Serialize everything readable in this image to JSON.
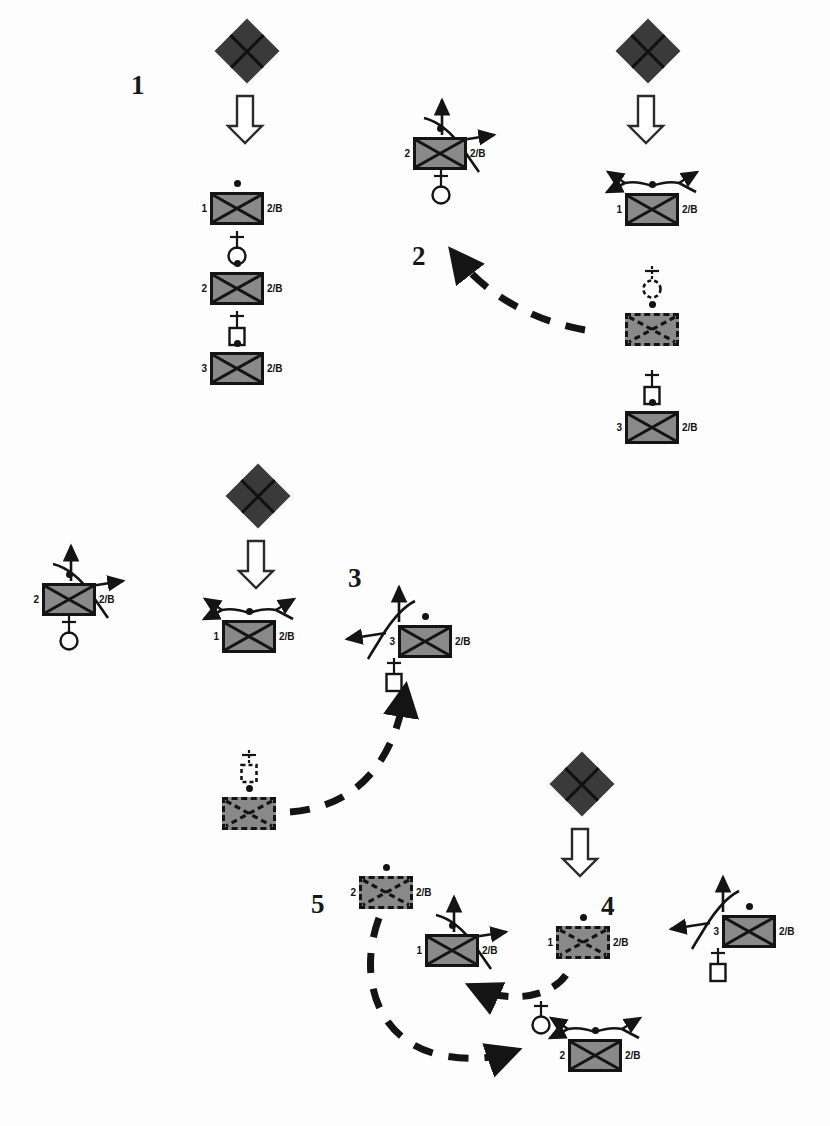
{
  "figure": {
    "kind": "reaction-scheme",
    "background": "#ffffff",
    "palette": {
      "box_fill": "#898989",
      "stroke": "#141414",
      "diamond_fill": "#3a3a3a",
      "label": "#131313"
    },
    "group_labels": [
      {
        "text": "1",
        "x": 131,
        "y": 72
      },
      {
        "text": "2",
        "x": 412,
        "y": 243
      },
      {
        "text": "3",
        "x": 348,
        "y": 565
      },
      {
        "text": "4",
        "x": 601,
        "y": 893
      },
      {
        "text": "5",
        "x": 311,
        "y": 891
      }
    ],
    "diamonds": [
      {
        "x": 224,
        "y": 28
      },
      {
        "x": 625,
        "y": 28
      },
      {
        "x": 235,
        "y": 473
      },
      {
        "x": 559,
        "y": 761
      }
    ],
    "down_arrows": [
      {
        "x": 228,
        "y": 96
      },
      {
        "x": 629,
        "y": 96
      },
      {
        "x": 239,
        "y": 541
      },
      {
        "x": 563,
        "y": 829
      }
    ],
    "units": [
      {
        "id": "g1-u1",
        "x": 210,
        "y": 192,
        "left": "1",
        "right": "2/B",
        "dashed": false,
        "dot": true,
        "deco": "none"
      },
      {
        "id": "g1-u2",
        "x": 210,
        "y": 272,
        "left": "2",
        "right": "2/B",
        "dashed": false,
        "dot": true,
        "deco": "none"
      },
      {
        "id": "g1-u3",
        "x": 210,
        "y": 352,
        "left": "3",
        "right": "2/B",
        "dashed": false,
        "dot": true,
        "deco": "none"
      },
      {
        "id": "g2-u1",
        "x": 413,
        "y": 137,
        "left": "2",
        "right": "2/B",
        "dashed": false,
        "dot": true,
        "deco": "bond-right"
      },
      {
        "id": "g1r-u1",
        "x": 625,
        "y": 193,
        "left": "1",
        "right": "2/B",
        "dashed": false,
        "dot": true,
        "deco": "spray-up"
      },
      {
        "id": "g1r-u2",
        "x": 625,
        "y": 313,
        "left": "",
        "right": "",
        "dashed": true,
        "dot": true,
        "deco": "none"
      },
      {
        "id": "g1r-u3",
        "x": 625,
        "y": 411,
        "left": "3",
        "right": "2/B",
        "dashed": false,
        "dot": true,
        "deco": "none"
      },
      {
        "id": "gl-u1",
        "x": 42,
        "y": 583,
        "left": "2",
        "right": "2/B",
        "dashed": false,
        "dot": true,
        "deco": "bond-right"
      },
      {
        "id": "g3-u1",
        "x": 222,
        "y": 620,
        "left": "1",
        "right": "2/B",
        "dashed": false,
        "dot": true,
        "deco": "spray-up"
      },
      {
        "id": "g3-u2",
        "x": 222,
        "y": 797,
        "left": "",
        "right": "",
        "dashed": true,
        "dot": true,
        "deco": "none"
      },
      {
        "id": "g3r-u1",
        "x": 398,
        "y": 625,
        "left": "3",
        "right": "2/B",
        "dashed": false,
        "dot": true,
        "deco": "bond-upleft"
      },
      {
        "id": "g5-u1",
        "x": 359,
        "y": 876,
        "left": "2",
        "right": "2/B",
        "dashed": true,
        "dot": true,
        "deco": "none"
      },
      {
        "id": "g5-u2",
        "x": 425,
        "y": 934,
        "left": "1",
        "right": "2/B",
        "dashed": false,
        "dot": true,
        "deco": "bond-right"
      },
      {
        "id": "g4-u1",
        "x": 556,
        "y": 926,
        "left": "1",
        "right": "2/B",
        "dashed": true,
        "dot": true,
        "deco": "none"
      },
      {
        "id": "g4r-u1",
        "x": 722,
        "y": 915,
        "left": "3",
        "right": "2/B",
        "dashed": false,
        "dot": true,
        "deco": "bond-upleft"
      },
      {
        "id": "g5-u3",
        "x": 568,
        "y": 1039,
        "left": "2",
        "right": "2/B",
        "dashed": false,
        "dot": true,
        "deco": "spray-up"
      }
    ],
    "connectors": [
      {
        "id": "g1-c1",
        "shape": "circle",
        "solid": true,
        "x": 224,
        "y": 231
      },
      {
        "id": "g1-c2",
        "shape": "square",
        "solid": true,
        "x": 224,
        "y": 311
      },
      {
        "id": "g2-c1",
        "shape": "circle",
        "solid": true,
        "x": 428,
        "y": 172
      },
      {
        "id": "g1r-c1",
        "shape": "circle",
        "solid": false,
        "x": 639,
        "y": 268
      },
      {
        "id": "g1r-c2",
        "shape": "square",
        "solid": true,
        "x": 639,
        "y": 370
      },
      {
        "id": "gl-c1",
        "shape": "circle",
        "solid": true,
        "x": 56,
        "y": 618
      },
      {
        "id": "g3-c1",
        "shape": "square",
        "solid": false,
        "x": 236,
        "y": 752
      },
      {
        "id": "g3r-c1",
        "shape": "square",
        "solid": true,
        "x": 381,
        "y": 660
      },
      {
        "id": "g4r-c1",
        "shape": "square",
        "solid": true,
        "x": 705,
        "y": 950
      },
      {
        "id": "g5-c3",
        "shape": "circle",
        "solid": true,
        "x": 528,
        "y": 1003
      }
    ],
    "flow_arrows": [
      {
        "id": "flow-2",
        "label": "curved dashed arrow from right column toward group 2"
      },
      {
        "id": "flow-3",
        "label": "curved dashed arrow from group 3 dashed unit to group 3 right unit"
      },
      {
        "id": "flow-4",
        "label": "curved dashed arrow from group 4 dashed unit to group 5 unit"
      },
      {
        "id": "flow-5",
        "label": "long dashed arrow from group 5 unit to bottom unit"
      }
    ]
  }
}
